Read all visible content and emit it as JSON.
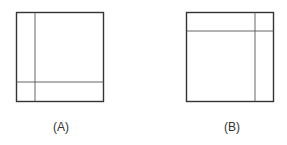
{
  "figures": [
    {
      "label": "(A)",
      "description": "Square divided by a vertical line near the left edge and a horizontal line near the bottom edge"
    },
    {
      "label": "(B)",
      "description": "Square divided by a vertical line near the right edge and a horizontal line near the top edge"
    }
  ],
  "colors": {
    "stroke": "#333333",
    "inner_stroke": "#555555"
  }
}
